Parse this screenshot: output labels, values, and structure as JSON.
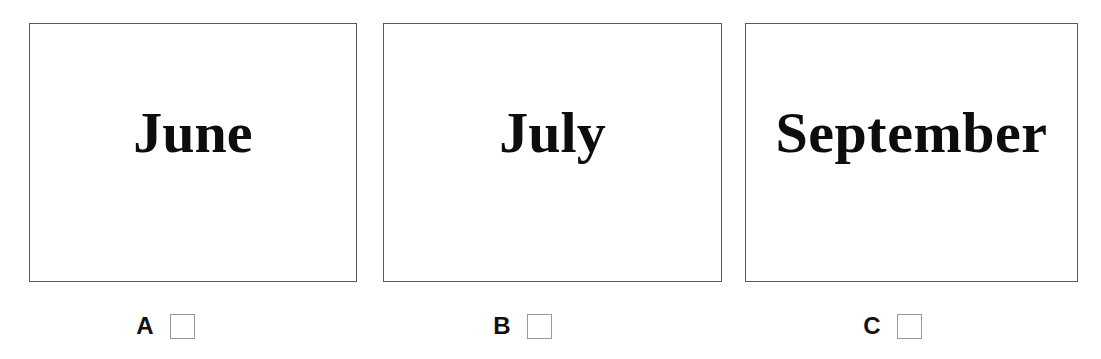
{
  "page": {
    "background_color": "#ffffff",
    "width": 1101,
    "height": 359
  },
  "style": {
    "card_border_color": "#5a5a5a",
    "card_fill_color": "#ffffff",
    "word_color": "#0d0d0d",
    "letter_color": "#111111",
    "checkbox_border_color": "#9a9a9a",
    "checkbox_fill_color": "#ffffff"
  },
  "cards": [
    {
      "word": "June",
      "letter": "A",
      "checkbox_checked": false,
      "frame": {
        "left": 29,
        "top": 23,
        "width": 328,
        "height": 259
      },
      "answer_row": {
        "left": 135,
        "top": 310
      }
    },
    {
      "word": "July",
      "letter": "B",
      "checkbox_checked": false,
      "frame": {
        "left": 383,
        "top": 23,
        "width": 339,
        "height": 259
      },
      "answer_row": {
        "left": 492,
        "top": 310
      }
    },
    {
      "word": "September",
      "letter": "C",
      "checkbox_checked": false,
      "frame": {
        "left": 745,
        "top": 23,
        "width": 333,
        "height": 259
      },
      "answer_row": {
        "left": 862,
        "top": 310
      }
    }
  ]
}
